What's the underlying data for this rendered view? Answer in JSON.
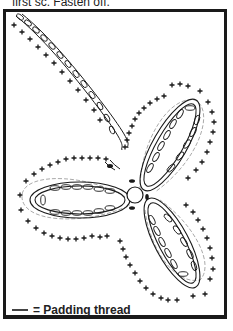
{
  "caption_top": "first sc. Fasten off.",
  "diagram": {
    "symbols": {
      "chain": "oval",
      "single_crochet": "+",
      "padding_color": "#aaaaaa",
      "ink_color": "#1a1a1a"
    }
  },
  "legend": {
    "label": "= Padding thread"
  }
}
